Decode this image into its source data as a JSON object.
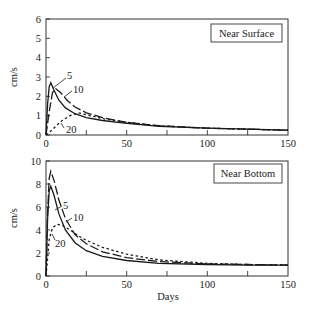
{
  "chart_data": [
    {
      "type": "line",
      "panel_title": "Near Surface",
      "xlabel": "",
      "ylabel": "cm/s",
      "xlim": [
        0,
        150
      ],
      "ylim": [
        0,
        6
      ],
      "x_ticks": [
        0,
        50,
        100,
        150
      ],
      "x_minor_ticks": [
        25,
        75,
        125
      ],
      "y_ticks": [
        0,
        1,
        2,
        3,
        4,
        5,
        6
      ],
      "grid": false,
      "series": [
        {
          "name": "5",
          "style": "solid",
          "x": [
            0,
            1,
            2,
            3,
            5,
            8,
            12,
            18,
            25,
            35,
            50,
            70,
            100,
            125,
            150
          ],
          "y": [
            0,
            1.6,
            2.5,
            2.7,
            2.3,
            1.8,
            1.4,
            1.1,
            0.9,
            0.75,
            0.6,
            0.45,
            0.35,
            0.3,
            0.25
          ]
        },
        {
          "name": "10",
          "style": "long-dash",
          "x": [
            0,
            2,
            4,
            6,
            9,
            13,
            18,
            25,
            35,
            50,
            70,
            100,
            125,
            150
          ],
          "y": [
            0,
            1.2,
            2.2,
            2.4,
            2.2,
            1.8,
            1.45,
            1.15,
            0.9,
            0.65,
            0.48,
            0.35,
            0.3,
            0.25
          ]
        },
        {
          "name": "20",
          "style": "short-dash",
          "x": [
            0,
            3,
            6,
            10,
            15,
            20,
            25,
            35,
            50,
            70,
            100,
            125,
            150
          ],
          "y": [
            0,
            0.2,
            0.45,
            0.75,
            1.0,
            1.15,
            1.05,
            0.85,
            0.65,
            0.48,
            0.35,
            0.3,
            0.25
          ]
        }
      ],
      "annotations": [
        "5",
        "10",
        "20"
      ]
    },
    {
      "type": "line",
      "panel_title": "Near Bottom",
      "xlabel": "Days",
      "ylabel": "cm/s",
      "xlim": [
        0,
        150
      ],
      "ylim": [
        0,
        10
      ],
      "x_ticks": [
        0,
        50,
        100,
        150
      ],
      "x_minor_ticks": [
        25,
        75,
        125
      ],
      "y_ticks": [
        0,
        2,
        4,
        6,
        8,
        10
      ],
      "grid": false,
      "series": [
        {
          "name": "5",
          "style": "solid",
          "x": [
            0,
            1,
            2,
            3,
            5,
            8,
            12,
            18,
            25,
            35,
            50,
            70,
            100,
            125,
            150
          ],
          "y": [
            0,
            5.0,
            7.4,
            7.8,
            7.0,
            5.4,
            4.0,
            2.9,
            2.2,
            1.7,
            1.35,
            1.1,
            1.0,
            0.95,
            0.95
          ]
        },
        {
          "name": "10",
          "style": "long-dash",
          "x": [
            0,
            1,
            2,
            3,
            5,
            8,
            12,
            18,
            25,
            35,
            50,
            70,
            100,
            125,
            150
          ],
          "y": [
            0,
            5.5,
            8.5,
            9.1,
            8.3,
            6.6,
            5.0,
            3.6,
            2.8,
            2.1,
            1.6,
            1.25,
            1.05,
            1.0,
            0.95
          ]
        },
        {
          "name": "20",
          "style": "short-dash",
          "x": [
            0,
            1,
            2,
            4,
            7,
            10,
            15,
            20,
            25,
            35,
            50,
            70,
            100,
            125,
            150
          ],
          "y": [
            0,
            1.5,
            3.2,
            4.2,
            4.5,
            4.4,
            4.0,
            3.5,
            3.1,
            2.5,
            1.9,
            1.4,
            1.1,
            1.0,
            0.95
          ]
        }
      ],
      "annotations": [
        "5",
        "10",
        "20"
      ]
    }
  ],
  "panels": {
    "top": {
      "title": "Near Surface",
      "ylabel": "cm/s",
      "y_tick_labels": [
        "0",
        "1",
        "2",
        "3",
        "4",
        "5",
        "6"
      ],
      "x_tick_labels": [
        "0",
        "50",
        "100",
        "150"
      ],
      "curve_labels": [
        "5",
        "10",
        "20"
      ]
    },
    "bottom": {
      "title": "Near Bottom",
      "ylabel": "cm/s",
      "xlabel": "Days",
      "y_tick_labels": [
        "0",
        "2",
        "4",
        "6",
        "8",
        "10"
      ],
      "x_tick_labels": [
        "0",
        "50",
        "100",
        "150"
      ],
      "curve_labels": [
        "5",
        "10",
        "20"
      ]
    }
  }
}
